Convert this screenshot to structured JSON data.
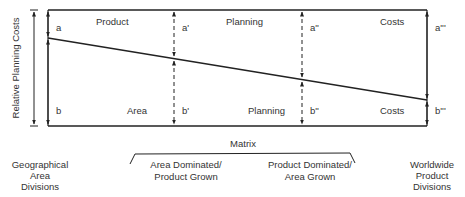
{
  "diagram": {
    "y_axis_label": "Relative Planning Costs",
    "upper_band_words": [
      "Product",
      "Planning",
      "Costs"
    ],
    "lower_band_words": [
      "Area",
      "Planning",
      "Costs"
    ],
    "upper_markers": [
      "a",
      "a'",
      "a''",
      "a'''"
    ],
    "lower_markers": [
      "b",
      "b'",
      "b''",
      "b'''"
    ],
    "matrix_label": "Matrix",
    "matrix_left_label": [
      "Area Dominated/",
      "Product Grown"
    ],
    "matrix_right_label": [
      "Product Dominated/",
      "Area Grown"
    ],
    "left_endpoint_label": [
      "Geographical",
      "Area",
      "Divisions"
    ],
    "right_endpoint_label": [
      "Worldwide",
      "Product",
      "Divisions"
    ],
    "colors": {
      "line": "#222222",
      "text": "#333333",
      "background": "#ffffff"
    }
  }
}
